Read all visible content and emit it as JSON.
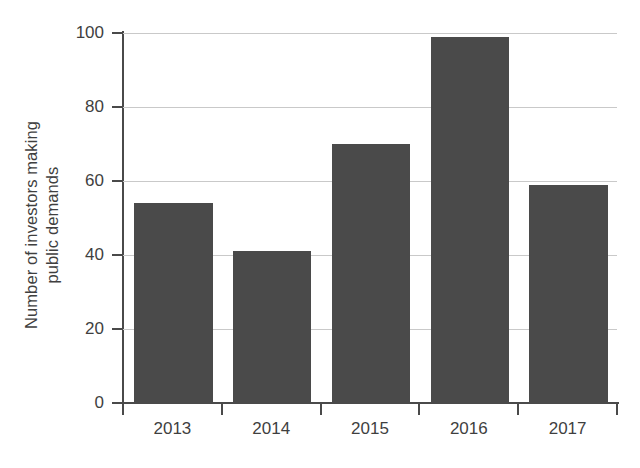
{
  "chart_data": {
    "type": "bar",
    "title": "",
    "subtitle": "",
    "xlabel": "",
    "ylabel": "Number of investors making public demands",
    "ylabel_lines": [
      "Number of investors making",
      "public demands"
    ],
    "categories": [
      "2013",
      "2014",
      "2015",
      "2016",
      "2017"
    ],
    "values": [
      54,
      41,
      70,
      99,
      59
    ],
    "series": [
      {
        "name": "Number of investors making public demands",
        "values": [
          54,
          41,
          70,
          99,
          59
        ]
      }
    ],
    "ylim": [
      0,
      100
    ],
    "y_ticks": [
      0,
      20,
      40,
      60,
      80,
      100
    ],
    "y_tick_labels": [
      "0",
      "20",
      "40",
      "60",
      "80",
      "100"
    ],
    "x_tick_labels": [
      "2013",
      "2014",
      "2015",
      "2016",
      "2017"
    ],
    "grid": true,
    "grid_axis": "y",
    "legend": false,
    "legend_position": "none",
    "annotations": [],
    "colors": {
      "bar_fill": "#4a4a4a",
      "gridline": "#c9c9c9",
      "axis_line": "#4a4a4a",
      "text": "#3f3f3f",
      "background": "#ffffff"
    }
  }
}
